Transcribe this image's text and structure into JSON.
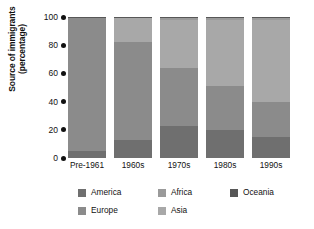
{
  "chart_data": {
    "type": "bar",
    "title": "",
    "subtitle": "",
    "xlabel": "",
    "ylabel": "Source of immigrants (percentage)",
    "ylabel_line1": "Source of immigrants",
    "ylabel_line2": "(percentage)",
    "stacked": true,
    "grid": false,
    "legend_position": "bottom",
    "ylim": [
      0,
      100
    ],
    "yticks": [
      "0",
      "20",
      "40",
      "60",
      "80",
      "100"
    ],
    "ytick_values": [
      0,
      20,
      40,
      60,
      80,
      100
    ],
    "categories": [
      "Pre-1961",
      "1960s",
      "1970s",
      "1980s",
      "1990s"
    ],
    "series": [
      {
        "name": "America",
        "color": "#6f6f6f",
        "values": [
          5,
          13,
          23,
          20,
          15
        ]
      },
      {
        "name": "Europe",
        "color": "#8b8b8b",
        "values": [
          94,
          69,
          41,
          31,
          25
        ]
      },
      {
        "name": "Asia",
        "color": "#a8a8a8",
        "values": [
          0,
          17,
          34,
          47,
          58
        ]
      },
      {
        "name": "Africa",
        "color": "#9a9a9a",
        "values": [
          0.5,
          0.5,
          1,
          1,
          1
        ]
      },
      {
        "name": "Oceania",
        "color": "#575757",
        "values": [
          0.5,
          0.5,
          1,
          1,
          1
        ]
      }
    ]
  },
  "legend": {
    "columns": [
      [
        {
          "label": "America",
          "color": "#6f6f6f"
        },
        {
          "label": "Europe",
          "color": "#8b8b8b"
        }
      ],
      [
        {
          "label": "Africa",
          "color": "#9a9a9a"
        },
        {
          "label": "Asia",
          "color": "#a8a8a8"
        }
      ],
      [
        {
          "label": "Oceania",
          "color": "#575757"
        }
      ]
    ]
  }
}
